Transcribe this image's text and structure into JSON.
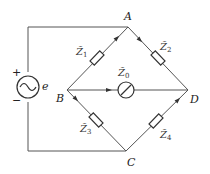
{
  "diagram": {
    "type": "AC bridge circuit",
    "nodes": {
      "A": "A",
      "B": "B",
      "C": "C",
      "D": "D"
    },
    "source": {
      "label": "e",
      "plus": "+",
      "minus": "−",
      "symbol": "ac-source"
    },
    "impedances": {
      "z1": {
        "name": "Z̃",
        "sub": "1",
        "branch": "B-A"
      },
      "z2": {
        "name": "Z̃",
        "sub": "2",
        "branch": "A-D"
      },
      "z3": {
        "name": "Z̃",
        "sub": "3",
        "branch": "B-C"
      },
      "z4": {
        "name": "Z̃",
        "sub": "4",
        "branch": "C-D"
      },
      "z0": {
        "name": "Z̃",
        "sub": "0",
        "branch": "B-D",
        "element": "galvanometer"
      }
    }
  }
}
